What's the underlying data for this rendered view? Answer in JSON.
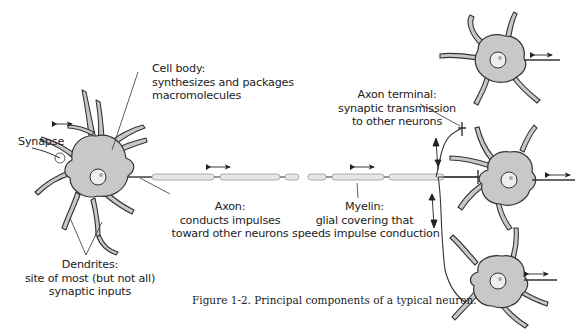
{
  "figure": {
    "caption": "Figure 1-2. Principal components of a typical neuron."
  },
  "labels": {
    "cell_body": {
      "title": "Cell body:",
      "line1": "synthesizes and packages",
      "line2": "macromolecules"
    },
    "synapse": {
      "title": "Synapse"
    },
    "axon": {
      "title": "Axon:",
      "line1": "conducts impulses",
      "line2": "toward other neurons"
    },
    "myelin": {
      "title": "Myelin:",
      "line1": "glial covering that",
      "line2": "speeds impulse conduction"
    },
    "axon_terminal": {
      "title": "Axon terminal:",
      "line1": "synaptic transmission",
      "line2": "to other neurons"
    },
    "dendrites": {
      "title": "Dendrites:",
      "line1": "site of most (but not all)",
      "line2": "synaptic inputs"
    }
  },
  "colors": {
    "cell_fill": "#c8c8c8",
    "outline": "#333333",
    "myelin_fill": "#e6e6e6",
    "nucleus_fill": "#eeeeee",
    "text": "#222222"
  }
}
